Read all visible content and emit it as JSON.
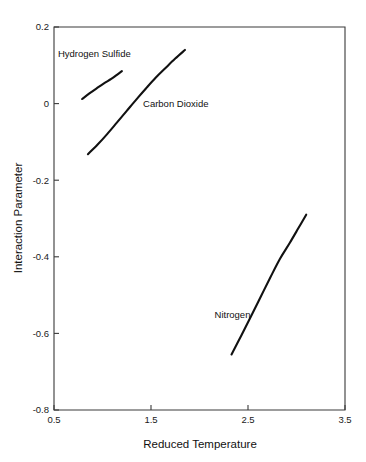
{
  "chart_data": {
    "type": "line",
    "title": "",
    "xlabel": "Reduced Temperature",
    "ylabel": "Interaction Parameter",
    "xlim": [
      0.5,
      3.5
    ],
    "ylim": [
      -0.8,
      0.2
    ],
    "xticks": [
      0.5,
      1.5,
      2.5,
      3.5
    ],
    "xtick_labels": [
      "0.5",
      "1.5",
      "2.5",
      "3.5"
    ],
    "yticks": [
      0.2,
      0,
      -0.2,
      -0.4,
      -0.6,
      -0.8
    ],
    "ytick_labels": [
      "0.2",
      "0",
      "-0.2",
      "-0.4",
      "-0.6",
      "-0.8"
    ],
    "grid": false,
    "legend": "inline-annotations",
    "series": [
      {
        "name": "Hydrogen Sulfide",
        "label_x": 0.54,
        "label_y": 0.122,
        "points": [
          [
            0.79,
            0.012
          ],
          [
            0.865,
            0.0265
          ],
          [
            0.94,
            0.04
          ],
          [
            1.015,
            0.053
          ],
          [
            1.09,
            0.0645
          ],
          [
            1.145,
            0.0745
          ],
          [
            1.2,
            0.085
          ]
        ]
      },
      {
        "name": "Carbon Dioxide",
        "label_x": 1.418,
        "label_y": -0.0095,
        "points": [
          [
            0.85,
            -0.132
          ],
          [
            0.95,
            -0.107
          ],
          [
            1.05,
            -0.079
          ],
          [
            1.15,
            -0.049
          ],
          [
            1.25,
            -0.019
          ],
          [
            1.35,
            0.011
          ],
          [
            1.45,
            0.04
          ],
          [
            1.55,
            0.068
          ],
          [
            1.65,
            0.093
          ],
          [
            1.75,
            0.1175
          ],
          [
            1.85,
            0.14
          ]
        ]
      },
      {
        "name": "Nitrogen",
        "label_x": 2.155,
        "label_y": -0.559,
        "points": [
          [
            2.33,
            -0.655
          ],
          [
            2.43,
            -0.606
          ],
          [
            2.53,
            -0.556
          ],
          [
            2.63,
            -0.505
          ],
          [
            2.73,
            -0.454
          ],
          [
            2.83,
            -0.405
          ],
          [
            2.93,
            -0.364
          ],
          [
            3.02,
            -0.325
          ],
          [
            3.1,
            -0.29
          ]
        ]
      }
    ]
  }
}
